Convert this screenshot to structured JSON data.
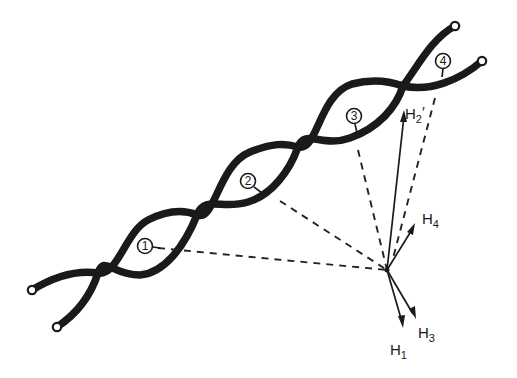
{
  "diagram": {
    "colors": {
      "ink": "#1a1a1a",
      "background": "#ffffff"
    },
    "sites": [
      {
        "id": "site-1",
        "label": "1"
      },
      {
        "id": "site-2",
        "label": "2"
      },
      {
        "id": "site-3",
        "label": "3"
      },
      {
        "id": "site-4",
        "label": "4"
      }
    ],
    "vectors": [
      {
        "id": "H1",
        "base": "H",
        "sub": "1",
        "prime": ""
      },
      {
        "id": "H2p",
        "base": "H",
        "sub": "2",
        "prime": "′"
      },
      {
        "id": "H3",
        "base": "H",
        "sub": "3",
        "prime": ""
      },
      {
        "id": "H4",
        "base": "H",
        "sub": "4",
        "prime": ""
      }
    ]
  }
}
